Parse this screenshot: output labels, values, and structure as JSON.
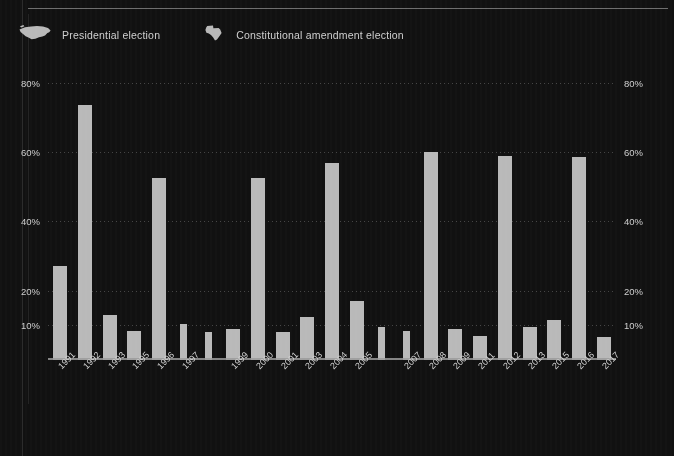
{
  "legend": {
    "items": [
      {
        "label": "Presidential election",
        "icon": "us-map-icon",
        "color": "#b9b9b9"
      },
      {
        "label": "Constitutional amendment election",
        "icon": "texas-map-icon",
        "color": "#b9b9b9"
      }
    ]
  },
  "axis": {
    "y_ticks_left": [
      "80%",
      "60%",
      "40%",
      "20%",
      "10%"
    ],
    "y_ticks_right": [
      "80%",
      "60%",
      "40%",
      "20%",
      "10%"
    ]
  },
  "colors": {
    "background": "#111111",
    "bar": "#b9b9b9",
    "grid": "#6f6f6f",
    "text": "#d2d2d2",
    "axis": "#9a9a9a"
  },
  "chart_data": {
    "type": "bar",
    "title": "",
    "subtitle": "",
    "xlabel": "",
    "ylabel": "",
    "ylim": [
      0,
      84
    ],
    "yticks": [
      10,
      20,
      40,
      60,
      80
    ],
    "ytick_labels": [
      "10%",
      "20%",
      "40%",
      "60%",
      "80%"
    ],
    "grid": true,
    "legend_position": "top-left",
    "categories": [
      "1991",
      "1992",
      "1993",
      "1995",
      "1996",
      "1997",
      "1999",
      "2000",
      "2001",
      "2003",
      "2004",
      "2005",
      "2007",
      "2008",
      "2009",
      "2011",
      "2012",
      "2013",
      "2015",
      "2016",
      "2017"
    ],
    "series": [
      {
        "name": "Presidential election",
        "values": [
          null,
          73.5,
          null,
          null,
          null,
          null,
          null,
          null,
          null,
          null,
          57,
          null,
          null,
          60,
          null,
          null,
          59,
          null,
          null,
          58.5,
          null
        ]
      },
      {
        "name": "Constitutional amendment election",
        "values": [
          27,
          null,
          13,
          8.5,
          52.5,
          10.5,
          9,
          52.5,
          8,
          12.5,
          null,
          17,
          9.5,
          null,
          9,
          7,
          null,
          9.5,
          11.5,
          null,
          6.5
        ]
      }
    ],
    "bars": [
      {
        "year": "1991",
        "value": 27,
        "type": "amendment",
        "width": 14
      },
      {
        "year": "1992",
        "value": 73.5,
        "type": "presidential",
        "width": 14
      },
      {
        "year": "1993",
        "value": 13,
        "type": "amendment",
        "width": 14
      },
      {
        "year": "1995",
        "value": 8.5,
        "type": "amendment",
        "width": 14
      },
      {
        "year": "1996",
        "value": 52.5,
        "type": "presidential",
        "width": 14
      },
      {
        "year": "1997",
        "value": 10.5,
        "type": "amendment",
        "width": 7
      },
      {
        "year": "1998",
        "value": 8,
        "type": "amendment",
        "width": 7
      },
      {
        "year": "1999",
        "value": 9,
        "type": "amendment",
        "width": 14
      },
      {
        "year": "2000",
        "value": 52.5,
        "type": "presidential",
        "width": 14
      },
      {
        "year": "2001",
        "value": 8,
        "type": "amendment",
        "width": 14
      },
      {
        "year": "2003",
        "value": 12.5,
        "type": "amendment",
        "width": 14
      },
      {
        "year": "2004",
        "value": 57,
        "type": "presidential",
        "width": 14
      },
      {
        "year": "2005",
        "value": 17,
        "type": "amendment",
        "width": 14
      },
      {
        "year": "2006",
        "value": 9.5,
        "type": "amendment",
        "width": 7
      },
      {
        "year": "2007",
        "value": 8.5,
        "type": "amendment",
        "width": 7
      },
      {
        "year": "2008",
        "value": 60,
        "type": "presidential",
        "width": 14
      },
      {
        "year": "2009",
        "value": 9,
        "type": "amendment",
        "width": 14
      },
      {
        "year": "2011",
        "value": 7,
        "type": "amendment",
        "width": 14
      },
      {
        "year": "2012",
        "value": 59,
        "type": "presidential",
        "width": 14
      },
      {
        "year": "2013",
        "value": 9.5,
        "type": "amendment",
        "width": 14
      },
      {
        "year": "2015",
        "value": 11.5,
        "type": "amendment",
        "width": 14
      },
      {
        "year": "2016",
        "value": 58.5,
        "type": "presidential",
        "width": 14
      },
      {
        "year": "2017",
        "value": 6.5,
        "type": "amendment",
        "width": 14
      }
    ]
  }
}
